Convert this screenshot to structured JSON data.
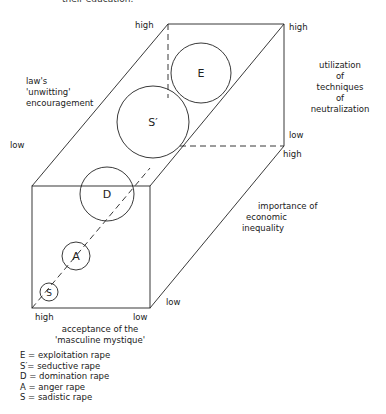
{
  "cut_text": "their education.",
  "axes": {
    "vertical_left": {
      "title": "law's 'unwitting' encouragement",
      "title_lines": [
        "law's",
        "'unwitting'",
        "encouragement"
      ],
      "high": "high",
      "low": "low"
    },
    "vertical_right": {
      "title": "utilization of techniques of neutralization",
      "title_lines": [
        "utilization",
        "of",
        "techniques",
        "of",
        "neutralization"
      ],
      "high": "high",
      "low": "low"
    },
    "depth": {
      "title": "importance of economic inequality",
      "title_lines": [
        "importance of",
        "economic",
        "inequality"
      ],
      "high": "high",
      "low": "low"
    },
    "horizontal": {
      "title": "acceptance of the 'masculine mystique'",
      "title_lines": [
        "acceptance of the",
        "'masculine mystique'"
      ],
      "high": "high",
      "low": "low"
    }
  },
  "circles": [
    {
      "id": "E",
      "label": "E",
      "cx": 201,
      "cy": 73,
      "r": 30
    },
    {
      "id": "S_prime",
      "label": "S′",
      "cx": 153,
      "cy": 122,
      "r": 36
    },
    {
      "id": "D",
      "label": "D",
      "cx": 107,
      "cy": 194,
      "r": 27
    },
    {
      "id": "A",
      "label": "A",
      "cx": 76,
      "cy": 256,
      "r": 14
    },
    {
      "id": "S",
      "label": "S",
      "cx": 49,
      "cy": 292,
      "r": 9
    }
  ],
  "legend": [
    {
      "key": "E",
      "text": "E = exploitation rape"
    },
    {
      "key": "S'",
      "text": "S′= seductive rape"
    },
    {
      "key": "D",
      "text": "D = domination rape"
    },
    {
      "key": "A",
      "text": "A = anger rape"
    },
    {
      "key": "S",
      "text": "S = sadistic rape"
    }
  ]
}
